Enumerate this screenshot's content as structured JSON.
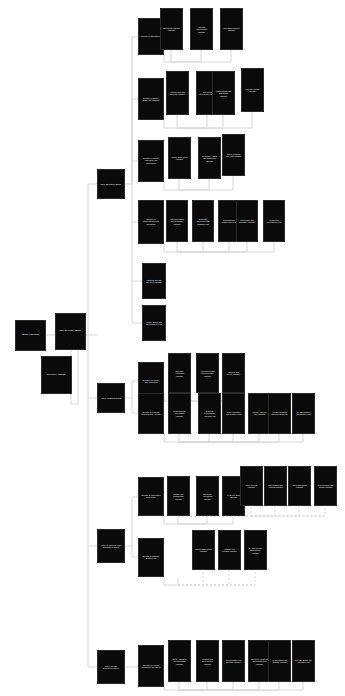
{
  "diagram": {
    "type": "tree",
    "orientation": "left-to-right",
    "background_color": "#ffffff",
    "node_fill": "#0a0a0a",
    "node_text_color": "#ffffff",
    "connector_color": "#d8d8d8",
    "connector_style_primary": "solid",
    "connector_style_secondary": "dashed"
  },
  "nodes": [
    {
      "id": "r1",
      "label": "Board of Directors",
      "x": 15,
      "y": 320,
      "w": 31,
      "h": 31,
      "fs": 2.4,
      "level": 0
    },
    {
      "id": "r2",
      "label": "Chief Executive Officer",
      "x": 55,
      "y": 313,
      "w": 31,
      "h": 37,
      "fs": 2.4,
      "level": 0
    },
    {
      "id": "r3",
      "label": "Executive Assistant",
      "x": 41,
      "y": 356,
      "w": 31,
      "h": 38,
      "fs": 2.4,
      "level": 0
    },
    {
      "id": "b1",
      "label": "Chief Operating Officer",
      "x": 97,
      "y": 169,
      "w": 28,
      "h": 30,
      "fs": 2.3,
      "level": 1
    },
    {
      "id": "b2",
      "label": "Chief Financial Officer",
      "x": 97,
      "y": 383,
      "w": 28,
      "h": 30,
      "fs": 2.3,
      "level": 1
    },
    {
      "id": "b3",
      "label": "Chief Technology and Information Officer",
      "x": 97,
      "y": 529,
      "w": 28,
      "h": 34,
      "fs": 2.3,
      "level": 1
    },
    {
      "id": "b4",
      "label": "Chief Human Resources Officer",
      "x": 97,
      "y": 650,
      "w": 28,
      "h": 34,
      "fs": 2.3,
      "level": 1
    },
    {
      "id": "c1",
      "label": "Director of Operations",
      "x": 138,
      "y": 18,
      "w": 26,
      "h": 37,
      "fs": 2.2,
      "level": 2
    },
    {
      "id": "c2",
      "label": "Director of Supply Chain and Logistics",
      "x": 138,
      "y": 78,
      "w": 26,
      "h": 42,
      "fs": 2.2,
      "level": 2
    },
    {
      "id": "c3",
      "label": "Director of Quality Assurance and Compliance",
      "x": 138,
      "y": 140,
      "w": 26,
      "h": 42,
      "fs": 2.2,
      "level": 2
    },
    {
      "id": "c4",
      "label": "Director of Manufacturing and Production",
      "x": 138,
      "y": 200,
      "w": 26,
      "h": 44,
      "fs": 2.2,
      "level": 2
    },
    {
      "id": "c5",
      "label": "Facilities and Site Services Manager",
      "x": 142,
      "y": 263,
      "w": 24,
      "h": 36,
      "fs": 2.2,
      "level": 2
    },
    {
      "id": "c6",
      "label": "Health, Safety and Environment Lead",
      "x": 142,
      "y": 305,
      "w": 24,
      "h": 36,
      "fs": 2.2,
      "level": 2
    },
    {
      "id": "d1",
      "label": "Director of Finance and Accounting",
      "x": 138,
      "y": 362,
      "w": 26,
      "h": 39,
      "fs": 2.2,
      "level": 2
    },
    {
      "id": "d2",
      "label": "Director of Financial Planning and Analysis",
      "x": 138,
      "y": 393,
      "w": 26,
      "h": 41,
      "fs": 2.2,
      "level": 2
    },
    {
      "id": "e1",
      "label": "Director of Information Technology",
      "x": 138,
      "y": 477,
      "w": 26,
      "h": 39,
      "fs": 2.2,
      "level": 2
    },
    {
      "id": "e2",
      "label": "Director of Software Engineering",
      "x": 138,
      "y": 538,
      "w": 26,
      "h": 39,
      "fs": 2.2,
      "level": 2
    },
    {
      "id": "f1",
      "label": "Director of Human Resources and Talent",
      "x": 138,
      "y": 645,
      "w": 26,
      "h": 42,
      "fs": 2.2,
      "level": 2
    },
    {
      "id": "g1",
      "label": "Operations Planning Manager",
      "x": 160,
      "y": 8,
      "w": 23,
      "h": 42,
      "fs": 2.1,
      "level": 3
    },
    {
      "id": "g2",
      "label": "Process Improvement Manager",
      "x": 190,
      "y": 8,
      "w": 23,
      "h": 42,
      "fs": 2.1,
      "level": 3
    },
    {
      "id": "g3",
      "label": "Operations Support Manager",
      "x": 220,
      "y": 8,
      "w": 23,
      "h": 42,
      "fs": 2.1,
      "level": 3
    },
    {
      "id": "h1",
      "label": "Procurement and Sourcing Manager",
      "x": 166,
      "y": 71,
      "w": 23,
      "h": 44,
      "fs": 2.1,
      "level": 3
    },
    {
      "id": "h2",
      "label": "Warehouse Operations Manager",
      "x": 196,
      "y": 71,
      "w": 23,
      "h": 44,
      "fs": 2.1,
      "level": 3
    },
    {
      "id": "h3",
      "label": "Transportation and Distribution Manager",
      "x": 212,
      "y": 71,
      "w": 23,
      "h": 44,
      "fs": 2.1,
      "level": 3
    },
    {
      "id": "h4",
      "label": "Inventory Control Manager",
      "x": 241,
      "y": 68,
      "w": 23,
      "h": 44,
      "fs": 2.1,
      "level": 3
    },
    {
      "id": "i1",
      "label": "Quality Engineering Manager",
      "x": 168,
      "y": 137,
      "w": 23,
      "h": 42,
      "fs": 2.1,
      "level": 3
    },
    {
      "id": "i2",
      "label": "Regulatory Affairs and Compliance Manager",
      "x": 198,
      "y": 137,
      "w": 23,
      "h": 42,
      "fs": 2.1,
      "level": 3
    },
    {
      "id": "i3",
      "label": "Quality Systems and Audit Manager",
      "x": 222,
      "y": 134,
      "w": 23,
      "h": 42,
      "fs": 2.1,
      "level": 3
    },
    {
      "id": "j1",
      "label": "Plant Operations and Production Manager",
      "x": 166,
      "y": 200,
      "w": 22,
      "h": 42,
      "fs": 2.1,
      "level": 3
    },
    {
      "id": "j2",
      "label": "Production Scheduling and Planning Lead",
      "x": 192,
      "y": 200,
      "w": 22,
      "h": 42,
      "fs": 2.1,
      "level": 3
    },
    {
      "id": "j3",
      "label": "Manufacturing Engineering Lead",
      "x": 218,
      "y": 200,
      "w": 22,
      "h": 42,
      "fs": 2.1,
      "level": 3
    },
    {
      "id": "j4",
      "label": "Maintenance and Reliability Manager",
      "x": 236,
      "y": 200,
      "w": 22,
      "h": 42,
      "fs": 2.1,
      "level": 3
    },
    {
      "id": "j5",
      "label": "Continuous Improvement Lead",
      "x": 263,
      "y": 200,
      "w": 22,
      "h": 42,
      "fs": 2.1,
      "level": 3
    },
    {
      "id": "k1",
      "label": "Corporate Accounting Manager",
      "x": 168,
      "y": 353,
      "w": 23,
      "h": 40,
      "fs": 2.1,
      "level": 3
    },
    {
      "id": "k2",
      "label": "Accounts Payable and Receivable Manager",
      "x": 196,
      "y": 353,
      "w": 23,
      "h": 40,
      "fs": 2.1,
      "level": 3
    },
    {
      "id": "k3",
      "label": "Treasury and Payroll Manager",
      "x": 222,
      "y": 353,
      "w": 23,
      "h": 40,
      "fs": 2.1,
      "level": 3
    },
    {
      "id": "l1",
      "label": "Budgeting and Forecasting Manager",
      "x": 168,
      "y": 393,
      "w": 23,
      "h": 41,
      "fs": 2.1,
      "level": 3
    },
    {
      "id": "l2",
      "label": "Business Performance Analytics Lead",
      "x": 198,
      "y": 393,
      "w": 23,
      "h": 41,
      "fs": 2.1,
      "level": 3
    },
    {
      "id": "l3",
      "label": "Cost Accounting and Controls Lead",
      "x": 222,
      "y": 393,
      "w": 23,
      "h": 41,
      "fs": 2.1,
      "level": 3
    },
    {
      "id": "l4",
      "label": "Internal Audit and Risk Manager",
      "x": 248,
      "y": 393,
      "w": 23,
      "h": 41,
      "fs": 2.1,
      "level": 3
    },
    {
      "id": "l5",
      "label": "Investor Relations and Reporting Lead",
      "x": 268,
      "y": 393,
      "w": 23,
      "h": 41,
      "fs": 2.1,
      "level": 3
    },
    {
      "id": "l6",
      "label": "Tax and Statutory Compliance Lead",
      "x": 292,
      "y": 393,
      "w": 23,
      "h": 41,
      "fs": 2.1,
      "level": 3
    },
    {
      "id": "m1",
      "label": "Network and Infrastructure Manager",
      "x": 167,
      "y": 476,
      "w": 23,
      "h": 40,
      "fs": 2.1,
      "level": 4
    },
    {
      "id": "m2",
      "label": "Enterprise Applications Manager",
      "x": 196,
      "y": 476,
      "w": 23,
      "h": 40,
      "fs": 2.1,
      "level": 4
    },
    {
      "id": "m3",
      "label": "IT Service Desk Manager",
      "x": 222,
      "y": 476,
      "w": 23,
      "h": 40,
      "fs": 2.1,
      "level": 4
    },
    {
      "id": "m4",
      "label": "Cyber Security Manager",
      "x": 240,
      "y": 466,
      "w": 23,
      "h": 40,
      "fs": 2.1,
      "level": 4,
      "dashed": true
    },
    {
      "id": "m5",
      "label": "Data Platform and Analytics Manager",
      "x": 264,
      "y": 466,
      "w": 23,
      "h": 40,
      "fs": 2.1,
      "level": 4,
      "dashed": true
    },
    {
      "id": "m6",
      "label": "Cloud Operations Manager",
      "x": 288,
      "y": 466,
      "w": 23,
      "h": 40,
      "fs": 2.1,
      "level": 4,
      "dashed": true
    },
    {
      "id": "m7",
      "label": "IT Governance and Vendor Manager",
      "x": 314,
      "y": 466,
      "w": 23,
      "h": 40,
      "fs": 2.1,
      "level": 4,
      "dashed": true
    },
    {
      "id": "n1",
      "label": "Product Engineering Manager",
      "x": 192,
      "y": 530,
      "w": 23,
      "h": 40,
      "fs": 2.1,
      "level": 4,
      "dashed": true
    },
    {
      "id": "n2",
      "label": "Platform and DevOps Manager",
      "x": 218,
      "y": 530,
      "w": 23,
      "h": 40,
      "fs": 2.1,
      "level": 4,
      "dashed": true
    },
    {
      "id": "n3",
      "label": "QA and Release Engineering Manager",
      "x": 244,
      "y": 530,
      "w": 23,
      "h": 40,
      "fs": 2.1,
      "level": 4,
      "dashed": true
    },
    {
      "id": "o1",
      "label": "Talent Acquisition and Recruiting Manager",
      "x": 168,
      "y": 640,
      "w": 23,
      "h": 42,
      "fs": 2.1,
      "level": 3
    },
    {
      "id": "o2",
      "label": "Learning and Development Manager",
      "x": 196,
      "y": 640,
      "w": 23,
      "h": 42,
      "fs": 2.1,
      "level": 3
    },
    {
      "id": "o3",
      "label": "Compensation and Benefits Manager",
      "x": 222,
      "y": 640,
      "w": 23,
      "h": 42,
      "fs": 2.1,
      "level": 3
    },
    {
      "id": "o4",
      "label": "Employee Relations and Engagement Manager",
      "x": 248,
      "y": 640,
      "w": 23,
      "h": 42,
      "fs": 2.1,
      "level": 3
    },
    {
      "id": "o5",
      "label": "HR Operations and Systems Manager",
      "x": 268,
      "y": 640,
      "w": 23,
      "h": 42,
      "fs": 2.1,
      "level": 3
    },
    {
      "id": "o6",
      "label": "Diversity, Equity and Inclusion Lead",
      "x": 292,
      "y": 640,
      "w": 23,
      "h": 42,
      "fs": 2.1,
      "level": 3
    }
  ],
  "edges": [
    {
      "d": "M46,335 H56",
      "dash": false
    },
    {
      "d": "M70,335 V348 H71 V356",
      "dash": false
    },
    {
      "d": "M71,394 V404 H78 V335 H97",
      "dash": false
    },
    {
      "d": "M86,335 H88",
      "dash": false
    },
    {
      "d": "M88,184 V335",
      "dash": false
    },
    {
      "d": "M88,184 H97",
      "dash": false
    },
    {
      "d": "M88,335 V398 H97",
      "dash": false
    },
    {
      "d": "M88,398 V546 H97",
      "dash": false
    },
    {
      "d": "M88,546 V667 H97",
      "dash": false
    },
    {
      "d": "M125,184 H132 V37 H138",
      "dash": false
    },
    {
      "d": "M132,184 V99 H138",
      "dash": false
    },
    {
      "d": "M132,161 H138",
      "dash": false
    },
    {
      "d": "M132,222 H138",
      "dash": false
    },
    {
      "d": "M132,281 H142",
      "dash": false
    },
    {
      "d": "M132,323 H142",
      "dash": false
    },
    {
      "d": "M132,37 V323",
      "dash": false
    },
    {
      "d": "M164,55 V62 H171 V50",
      "dash": false
    },
    {
      "d": "M171,62 H201 V50",
      "dash": false
    },
    {
      "d": "M171,62 H231 V50",
      "dash": false
    },
    {
      "d": "M164,120 V128 H177 V115",
      "dash": false
    },
    {
      "d": "M177,128 H207 V115",
      "dash": false
    },
    {
      "d": "M177,128 H223 V115",
      "dash": false
    },
    {
      "d": "M177,128 H252 V112",
      "dash": false
    },
    {
      "d": "M164,182 V190 H179 V179",
      "dash": false
    },
    {
      "d": "M179,190 H209 V179",
      "dash": false
    },
    {
      "d": "M179,190 H233 V176",
      "dash": false
    },
    {
      "d": "M164,244 V252 H177 V242",
      "dash": false
    },
    {
      "d": "M177,252 H203 V242",
      "dash": false
    },
    {
      "d": "M177,252 H229 V242",
      "dash": false
    },
    {
      "d": "M177,252 H247 V242",
      "dash": false
    },
    {
      "d": "M177,252 H274 V242",
      "dash": false
    },
    {
      "d": "M125,398 H132 V381 H138",
      "dash": false
    },
    {
      "d": "M132,398 V413 H138",
      "dash": false
    },
    {
      "d": "M164,393 V401 H179 V393",
      "dash": false
    },
    {
      "d": "M179,401 H207 V393",
      "dash": false
    },
    {
      "d": "M179,401 H233 V393",
      "dash": false
    },
    {
      "d": "M164,434 V442 H179 V434",
      "dash": false
    },
    {
      "d": "M179,442 H209 V434",
      "dash": false
    },
    {
      "d": "M179,442 H233 V434",
      "dash": false
    },
    {
      "d": "M179,442 H259 V434",
      "dash": false
    },
    {
      "d": "M179,442 H279 V434",
      "dash": false
    },
    {
      "d": "M179,442 H303 V434",
      "dash": false
    },
    {
      "d": "M125,546 H132 V497 H138",
      "dash": false
    },
    {
      "d": "M132,546 V557 H138",
      "dash": false
    },
    {
      "d": "M164,516 V524 H178 V516",
      "dash": false
    },
    {
      "d": "M178,524 H207 V516",
      "dash": false
    },
    {
      "d": "M178,524 H233 V516",
      "dash": false
    },
    {
      "d": "M178,516 H251 V506",
      "dash": true
    },
    {
      "d": "M251,516 H275 V506",
      "dash": true
    },
    {
      "d": "M251,516 H299 V506",
      "dash": true
    },
    {
      "d": "M251,516 H325 V506",
      "dash": true
    },
    {
      "d": "M178,516 H325",
      "dash": true
    },
    {
      "d": "M164,577 V585 H178 V577",
      "dash": false
    },
    {
      "d": "M178,585 H203 V570",
      "dash": true
    },
    {
      "d": "M178,585 H229 V570",
      "dash": true
    },
    {
      "d": "M178,585 H255 V570",
      "dash": true
    },
    {
      "d": "M178,585 H255",
      "dash": true
    },
    {
      "d": "M125,667 H138",
      "dash": false
    },
    {
      "d": "M164,682 V690 H179 V682",
      "dash": false
    },
    {
      "d": "M179,690 H207 V682",
      "dash": false
    },
    {
      "d": "M179,690 H233 V682",
      "dash": false
    },
    {
      "d": "M179,690 H259 V682",
      "dash": false
    },
    {
      "d": "M179,690 H279 V682",
      "dash": false
    },
    {
      "d": "M179,690 H303 V682",
      "dash": false
    }
  ]
}
